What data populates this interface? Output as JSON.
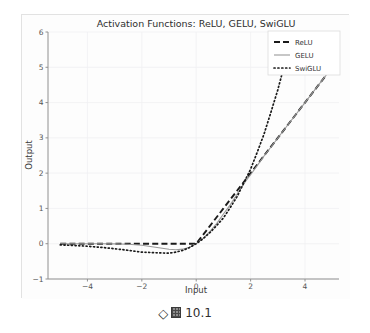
{
  "figure": {
    "caption_diamond": "◇",
    "caption_glyph_name": "boxed-cjk-glyph",
    "caption_number": "10.1"
  },
  "chart_data": {
    "type": "line",
    "title": "Activation Functions: ReLU, GELU, SwiGLU",
    "xlabel": "Input",
    "ylabel": "Output",
    "xlim": [
      -5.45,
      5.25
    ],
    "ylim": [
      -1,
      6
    ],
    "xticks": [
      -4,
      -2,
      0,
      2,
      4
    ],
    "xtick_labels": [
      "−4",
      "−2",
      "0",
      "2",
      "4"
    ],
    "yticks": [
      -1,
      0,
      1,
      2,
      3,
      4,
      5,
      6
    ],
    "ytick_labels": [
      "−1",
      "0",
      "1",
      "2",
      "3",
      "4",
      "5",
      "6"
    ],
    "grid": true,
    "legend_position": "upper right",
    "x": [
      -5.0,
      -4.5,
      -4.0,
      -3.5,
      -3.0,
      -2.5,
      -2.0,
      -1.5,
      -1.0,
      -0.75,
      -0.5,
      -0.25,
      0.0,
      0.25,
      0.5,
      0.75,
      1.0,
      1.25,
      1.5,
      1.75,
      2.0,
      2.25,
      2.5,
      2.75,
      3.0,
      3.5,
      4.0,
      4.5,
      5.0
    ],
    "series": [
      {
        "name": "ReLU",
        "style": "dashed",
        "color": "#1a1a1a",
        "values": [
          0.0,
          0.0,
          0.0,
          0.0,
          0.0,
          0.0,
          0.0,
          0.0,
          0.0,
          0.0,
          0.0,
          0.0,
          0.0,
          0.25,
          0.5,
          0.75,
          1.0,
          1.25,
          1.5,
          1.75,
          2.0,
          2.25,
          2.5,
          2.75,
          3.0,
          3.5,
          4.0,
          4.5,
          5.0
        ]
      },
      {
        "name": "GELU",
        "style": "solid",
        "color": "#9a9a9a",
        "values": [
          0.0,
          0.0,
          -0.0001,
          -0.0004,
          -0.004,
          -0.0155,
          -0.0455,
          -0.1003,
          -0.1587,
          -0.17,
          -0.1543,
          -0.103,
          0.0,
          0.1497,
          0.3457,
          0.57,
          0.8413,
          1.1023,
          1.3998,
          1.7044,
          1.9545,
          2.2211,
          2.4938,
          2.7404,
          2.996,
          3.4998,
          4.0,
          4.5,
          5.0
        ]
      },
      {
        "name": "SwiGLU",
        "style": "dotted",
        "color": "#1a1a1a",
        "values": [
          -0.0336,
          -0.0494,
          -0.0719,
          -0.1029,
          -0.1423,
          -0.1877,
          -0.2384,
          -0.256,
          -0.2689,
          -0.2385,
          -0.1888,
          -0.1105,
          0.0,
          0.1381,
          0.3112,
          0.5149,
          0.7311,
          1.023,
          1.3335,
          1.7194,
          2.1131,
          2.6063,
          3.1214,
          3.7356,
          4.3604,
          5.8331,
          7.48,
          9.242,
          11.04
        ]
      }
    ]
  }
}
